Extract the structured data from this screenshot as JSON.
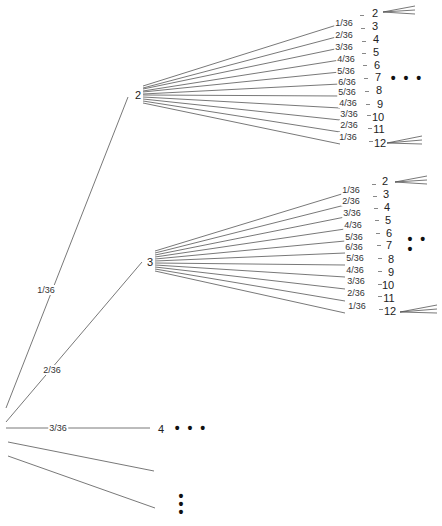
{
  "diagram": {
    "type": "probability-tree",
    "root_edges": [
      {
        "label": "1/36",
        "target": "2"
      },
      {
        "label": "2/36",
        "target": "3"
      },
      {
        "label": "3/36",
        "target": "4"
      }
    ],
    "level1_nodes": [
      "2",
      "3",
      "4"
    ],
    "ellipsis_horizontal": "• • •",
    "ellipsis_vertical": [
      "•",
      "•",
      "•"
    ],
    "subtree_a": {
      "parent": "2",
      "edge_labels": [
        "1/36",
        "2/36",
        "3/36",
        "4/36",
        "5/36",
        "6/36",
        "5/36",
        "4/36",
        "3/36",
        "2/36",
        "1/36"
      ],
      "children": [
        "2",
        "3",
        "4",
        "5",
        "6",
        "7",
        "8",
        "9",
        "10",
        "11",
        "12"
      ]
    },
    "subtree_b": {
      "parent": "3",
      "edge_labels": [
        "1/36",
        "2/36",
        "3/36",
        "4/36",
        "5/36",
        "6/36",
        "5/36",
        "4/36",
        "3/36",
        "2/36",
        "1/36"
      ],
      "children": [
        "2",
        "3",
        "4",
        "5",
        "6",
        "7",
        "8",
        "9",
        "10",
        "11",
        "12"
      ]
    }
  }
}
